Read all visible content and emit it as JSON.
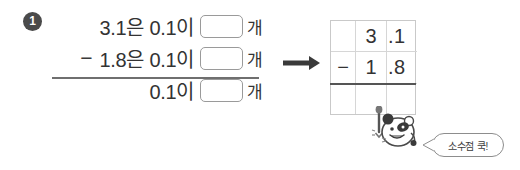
{
  "problem": {
    "number": "1"
  },
  "equations": {
    "rows": [
      {
        "operator": "",
        "text": "3.1은 0.1이",
        "blank_value": "",
        "unit": "개"
      },
      {
        "operator": "−",
        "text": "1.8은 0.1이",
        "blank_value": "",
        "unit": "개"
      },
      {
        "operator": "",
        "text": "0.1이",
        "blank_value": "",
        "unit": "개"
      }
    ]
  },
  "arrow": {
    "icon": "arrow-right-icon"
  },
  "vertical_grid": {
    "rows": [
      {
        "cells": [
          "",
          "3",
          ".1"
        ]
      },
      {
        "cells": [
          "−",
          "1",
          ".8"
        ]
      },
      {
        "cells": [
          "",
          "",
          ""
        ]
      }
    ]
  },
  "mascot": {
    "icon": "mascot-character-icon"
  },
  "speech_bubble": {
    "text": "소수점 쿡!"
  },
  "colors": {
    "text": "#333333",
    "badge_bg": "#4a4a4a",
    "rule": "#6f6f6f",
    "grid_border": "#c9c9c9",
    "box_border": "#9a9a9a"
  }
}
